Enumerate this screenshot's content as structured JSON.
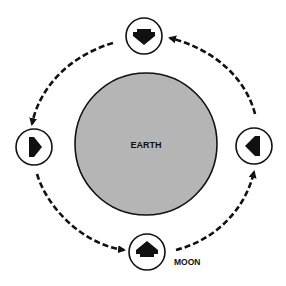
{
  "diagram": {
    "central_body": {
      "label": "EARTH",
      "fill": "#b5b5b5",
      "stroke": "#111111"
    },
    "orbiting_body": {
      "label": "MOON"
    },
    "orbit_direction": "counterclockwise",
    "moon_positions": [
      {
        "position": "top",
        "arrow_points": "down"
      },
      {
        "position": "left",
        "arrow_points": "right"
      },
      {
        "position": "bottom",
        "arrow_points": "up"
      },
      {
        "position": "right",
        "arrow_points": "left"
      }
    ],
    "orbit_arrows": [
      {
        "from": "top",
        "to": "left"
      },
      {
        "from": "left",
        "to": "bottom"
      },
      {
        "from": "bottom",
        "to": "right"
      },
      {
        "from": "right",
        "to": "top"
      }
    ]
  }
}
